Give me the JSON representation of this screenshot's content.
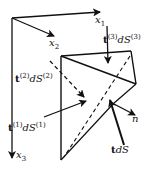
{
  "diagram": {
    "type": "Cauchy tetrahedron stress diagram",
    "axes": [
      {
        "id": "x1",
        "label": "x",
        "subscript": "1"
      },
      {
        "id": "x2",
        "label": "x",
        "subscript": "2"
      },
      {
        "id": "x3",
        "label": "x",
        "subscript": "3"
      }
    ],
    "tractions": [
      {
        "id": "t3",
        "vector": "t",
        "index": "(3)",
        "area": "dS",
        "area_index": "(3)"
      },
      {
        "id": "t2",
        "vector": "t",
        "index": "(2)",
        "area": "dS",
        "area_index": "(2)"
      },
      {
        "id": "t1",
        "vector": "t",
        "index": "(1)",
        "area": "dS",
        "area_index": "(1)"
      },
      {
        "id": "t",
        "vector": "t",
        "area": "dS"
      }
    ],
    "normal": {
      "label": "n"
    },
    "colors": {
      "stroke": "#111111",
      "background": "#ffffff"
    }
  }
}
